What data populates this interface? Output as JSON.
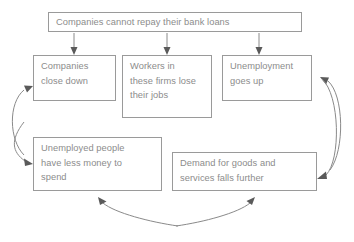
{
  "diagram": {
    "colors": {
      "box_border": "#9a9a9a",
      "box_text": "#8c8c8c",
      "connector": "#8a8a8a",
      "arrowhead": "#5a5a5a",
      "background": "#ffffff"
    },
    "nodes": [
      {
        "id": "top",
        "label": "Companies cannot repay their bank loans"
      },
      {
        "id": "close",
        "label": "Companies\nclose down"
      },
      {
        "id": "workers",
        "label": "Workers in\nthese firms lose\ntheir jobs"
      },
      {
        "id": "unemp",
        "label": "Unemployment\ngoes up"
      },
      {
        "id": "money",
        "label": "Unemployed people\nhave less money to\nspend"
      },
      {
        "id": "demand",
        "label": "Demand for goods and\nservices falls further"
      }
    ],
    "edges": [
      {
        "from": "top",
        "to": "close",
        "style": "straight-down"
      },
      {
        "from": "top",
        "to": "workers",
        "style": "straight-down"
      },
      {
        "from": "top",
        "to": "unemp",
        "style": "straight-down"
      },
      {
        "from": "money",
        "to": "close",
        "style": "curve-left"
      },
      {
        "from": "demand",
        "to": "money",
        "style": "curve-bottom-left"
      },
      {
        "from": "demand",
        "to": "unemp",
        "style": "curve-right"
      },
      {
        "from": "unemp",
        "to": "demand",
        "style": "curve-right-down"
      },
      {
        "from": "money",
        "to": "demand",
        "style": "curve-bottom-right"
      }
    ]
  }
}
